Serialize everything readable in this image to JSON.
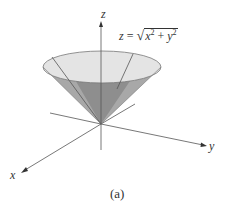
{
  "figure": {
    "equation": {
      "lhs": "z",
      "equals": "=",
      "radicand_x": "x",
      "radicand_exp1": "2",
      "plus": "+",
      "radicand_y": "y",
      "radicand_exp2": "2",
      "text": "z = √(x² + y²)"
    },
    "axes": {
      "x_label": "x",
      "y_label": "y",
      "z_label": "z"
    },
    "caption": "(a)",
    "colors": {
      "cone_inner": "#e6e6e6",
      "cone_outer": "#9a9a9a",
      "cone_dark": "#8c8c8c",
      "axis": "#555555",
      "rim": "#777777"
    }
  }
}
